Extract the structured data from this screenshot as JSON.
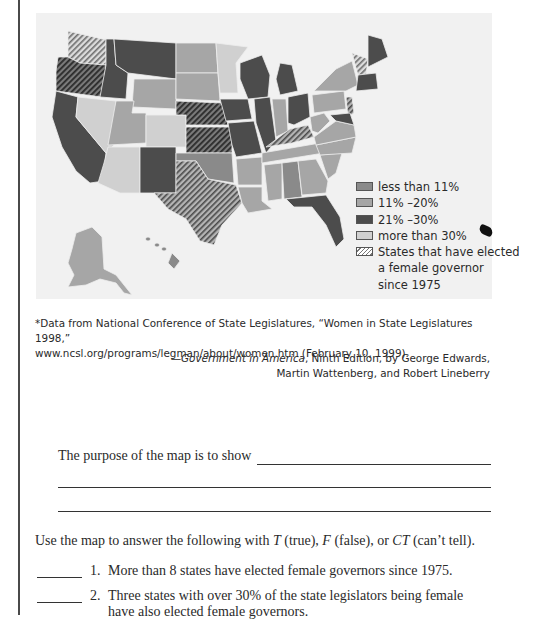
{
  "map": {
    "title_hidden": "",
    "legend": {
      "items": [
        {
          "key": "lt11",
          "label": "less than 11%",
          "color": "#8a8a8a"
        },
        {
          "key": "11-20",
          "label": "11% –20%",
          "color": "#a6a6a6"
        },
        {
          "key": "21-30",
          "label": "21% –30%",
          "color": "#4c4c4c"
        },
        {
          "key": "gt30",
          "label": "more than 30%",
          "color": "#d0d0d0"
        },
        {
          "key": "gov",
          "label": "States that have elected\na female governor\nsince 1975",
          "pattern": "diagonal-hatch"
        }
      ]
    }
  },
  "source": {
    "note_line1": "*Data from National Conference of State Legislatures, “Women in State Legislatures 1998,”",
    "note_line2": "www.ncsl.org/programs/legman/about/women.htm (February 10, 1999).",
    "credit_dash": "—",
    "credit_title": "Government in America",
    "credit_rest_line1": ", Ninth Edition, by George Edwards,",
    "credit_line2": "Martin Wattenberg, and Robert Lineberry"
  },
  "exercise": {
    "purpose_prompt": "The purpose of the map is to show",
    "instructions_prefix": "Use the map to answer the following with ",
    "t_label": "T",
    "t_desc": " (true), ",
    "f_label": "F",
    "f_desc": " (false), or ",
    "ct_label": "CT",
    "ct_desc": " (can’t tell).",
    "questions": [
      {
        "number": "1.",
        "text": "More than 8 states have elected female governors since 1975."
      },
      {
        "number": "2.",
        "text": "Three states with over 30% of the state legislators being female have also elected female governors."
      }
    ]
  }
}
